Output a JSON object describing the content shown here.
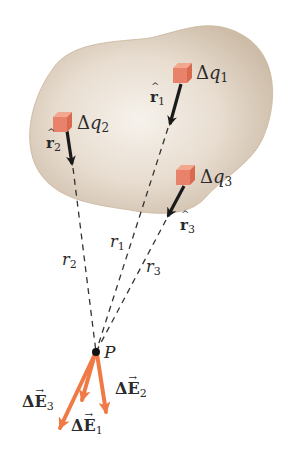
{
  "figure": {
    "colors": {
      "blob_fill": "#d9ccbb",
      "blob_center": "#f4efe8",
      "cube": "#e8826a",
      "cube_top": "#f2a78f",
      "unit_vector_arrow": "#1a1a1a",
      "field_vector": "#f07a45",
      "dashed_line": "#333333",
      "text": "#2a2a2a"
    },
    "charges": [
      {
        "id": "q1",
        "label_delta": "Δ",
        "label_var": "q",
        "label_sub": "1"
      },
      {
        "id": "q2",
        "label_delta": "Δ",
        "label_var": "q",
        "label_sub": "2"
      },
      {
        "id": "q3",
        "label_delta": "Δ",
        "label_var": "q",
        "label_sub": "3"
      }
    ],
    "unit_vectors": [
      {
        "id": "r1hat",
        "symbol": "r",
        "hat": "^",
        "sub": "1"
      },
      {
        "id": "r2hat",
        "symbol": "r",
        "hat": "^",
        "sub": "2"
      },
      {
        "id": "r3hat",
        "symbol": "r",
        "hat": "^",
        "sub": "3"
      }
    ],
    "distances": [
      {
        "id": "r1",
        "symbol": "r",
        "sub": "1"
      },
      {
        "id": "r2",
        "symbol": "r",
        "sub": "2"
      },
      {
        "id": "r3",
        "symbol": "r",
        "sub": "3"
      }
    ],
    "point": {
      "label": "P"
    },
    "field_vectors": [
      {
        "id": "E1",
        "delta": "Δ",
        "symbol": "E",
        "arrow": "→",
        "sub": "1"
      },
      {
        "id": "E2",
        "delta": "Δ",
        "symbol": "E",
        "arrow": "→",
        "sub": "2"
      },
      {
        "id": "E3",
        "delta": "Δ",
        "symbol": "E",
        "arrow": "→",
        "sub": "3"
      }
    ]
  }
}
